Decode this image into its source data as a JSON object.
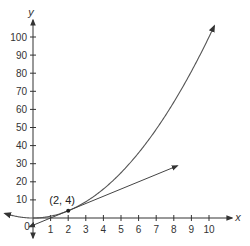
{
  "chart_data": {
    "type": "line",
    "title": "",
    "xlabel": "x",
    "ylabel": "y",
    "xlim": [
      -1.7,
      11
    ],
    "ylim": [
      -5,
      105
    ],
    "grid": false,
    "legend": null,
    "x_ticks": [
      "1",
      "2",
      "3",
      "4",
      "5",
      "6",
      "7",
      "8",
      "9",
      "10"
    ],
    "y_ticks": [
      "10",
      "20",
      "30",
      "40",
      "50",
      "60",
      "70",
      "80",
      "90",
      "100"
    ],
    "origin_label": "0",
    "series": [
      {
        "name": "parabola y = x^2",
        "x": [
          -1.5,
          -1,
          0,
          1,
          2,
          3,
          4,
          5,
          6,
          7,
          8,
          9,
          10,
          10.4
        ],
        "values": [
          2.25,
          1,
          0,
          1,
          4,
          9,
          16,
          25,
          36,
          49,
          64,
          81,
          100,
          108
        ]
      },
      {
        "name": "tangent line at (2, 4): y = 4x - 4",
        "x": [
          -0.2,
          2,
          8
        ],
        "values": [
          -4.8,
          4,
          28
        ]
      }
    ],
    "annotations": [
      {
        "text": "(2, 4)",
        "x": 2,
        "y": 4
      }
    ]
  },
  "labels": {
    "x_axis": "x",
    "y_axis": "y",
    "origin": "0",
    "point": "(2, 4)",
    "x_ticks": [
      "1",
      "2",
      "3",
      "4",
      "5",
      "6",
      "7",
      "8",
      "9",
      "10"
    ],
    "y_ticks": [
      "10",
      "20",
      "30",
      "40",
      "50",
      "60",
      "70",
      "80",
      "90",
      "100"
    ]
  },
  "colors": {
    "axis": "#333333",
    "curve": "#555555",
    "tangent": "#444444",
    "text": "#333333"
  }
}
